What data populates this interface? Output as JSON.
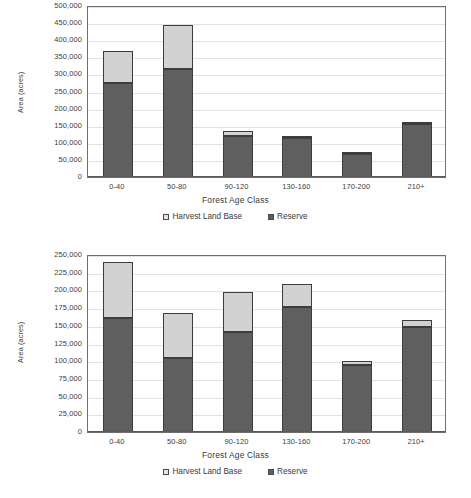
{
  "figure": {
    "caption": ""
  },
  "charts": [
    {
      "id": "chart-1",
      "ylabel": "Area (acres)",
      "xlabel": "Forest Age Class",
      "legend": [
        {
          "key": "harvest",
          "label": "Harvest Land Base"
        },
        {
          "key": "reserve",
          "label": "Reserve"
        }
      ],
      "yticks": [
        "500,000",
        "450,000",
        "400,000",
        "350,000",
        "300,000",
        "250,000",
        "200,000",
        "150,000",
        "100,000",
        "50,000",
        "0"
      ],
      "categories": [
        "0-40",
        "50-80",
        "90-120",
        "130-160",
        "170-200",
        "210+"
      ]
    },
    {
      "id": "chart-2",
      "ylabel": "Area (acres)",
      "xlabel": "Forest Age Class",
      "legend": [
        {
          "key": "harvest",
          "label": "Harvest Land Base"
        },
        {
          "key": "reserve",
          "label": "Reserve"
        }
      ],
      "yticks": [
        "250,000",
        "225,000",
        "200,000",
        "175,000",
        "150,000",
        "125,000",
        "100,000",
        "75,000",
        "50,000",
        "25,000",
        "0"
      ],
      "categories": [
        "0-40",
        "50-80",
        "90-120",
        "130-160",
        "170-200",
        "210+"
      ]
    }
  ],
  "chart_data": [
    {
      "type": "bar",
      "stacked": true,
      "title": "",
      "xlabel": "Forest Age Class",
      "ylabel": "Area (acres)",
      "categories": [
        "0-40",
        "50-80",
        "90-120",
        "130-160",
        "170-200",
        "210+"
      ],
      "series": [
        {
          "name": "Reserve",
          "color": "#5f5f5f",
          "values": [
            275000,
            316000,
            120000,
            115000,
            66000,
            155000
          ]
        },
        {
          "name": "Harvest Land Base",
          "color": "#d2d2d2",
          "values": [
            93000,
            128000,
            14000,
            4000,
            1000,
            3000
          ]
        }
      ],
      "totals": [
        368000,
        444000,
        134000,
        119000,
        67000,
        158000
      ],
      "ylim": [
        0,
        500000
      ],
      "ytick_step": 50000,
      "yticks": [
        0,
        50000,
        100000,
        150000,
        200000,
        250000,
        300000,
        350000,
        400000,
        450000,
        500000
      ],
      "grid": true,
      "legend_position": "bottom"
    },
    {
      "type": "bar",
      "stacked": true,
      "title": "",
      "xlabel": "Forest Age Class",
      "ylabel": "Area (acres)",
      "categories": [
        "0-40",
        "50-80",
        "90-120",
        "130-160",
        "170-200",
        "210+"
      ],
      "series": [
        {
          "name": "Reserve",
          "color": "#5f5f5f",
          "values": [
            161000,
            105000,
            141000,
            177000,
            94000,
            149000
          ]
        },
        {
          "name": "Harvest Land Base",
          "color": "#d2d2d2",
          "values": [
            79000,
            63000,
            57000,
            32000,
            6000,
            9000
          ]
        }
      ],
      "totals": [
        240000,
        168000,
        198000,
        209000,
        100000,
        158000
      ],
      "ylim": [
        0,
        250000
      ],
      "ytick_step": 25000,
      "yticks": [
        0,
        25000,
        50000,
        75000,
        100000,
        125000,
        150000,
        175000,
        200000,
        225000,
        250000
      ],
      "grid": true,
      "legend_position": "bottom"
    }
  ]
}
